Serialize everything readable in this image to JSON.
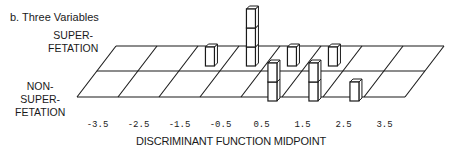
{
  "chart_data": {
    "type": "bar",
    "subtype": "3d-histogram",
    "title": "b. Three Variables",
    "xlabel": "DISCRIMINANT FUNCTION MIDPOINT",
    "ylabel": "",
    "categories": [
      "-3.5",
      "-2.5",
      "-1.5",
      "-0.5",
      "0.5",
      "1.5",
      "2.5",
      "3.5"
    ],
    "series": [
      {
        "name": "SUPER-\nFETATION",
        "label_lines": [
          "SUPER-",
          "FETATION"
        ],
        "values": [
          0,
          0,
          1,
          3,
          1,
          1,
          0,
          0
        ]
      },
      {
        "name": "NON-\nSUPER-\nFETATION",
        "label_lines": [
          "NON-",
          "SUPER-",
          "FETATION"
        ],
        "values": [
          0,
          0,
          0,
          0,
          2,
          2,
          1,
          0
        ]
      }
    ],
    "grid": true,
    "legend": "row labels on left"
  },
  "colors": {
    "line": "#1a1a1a",
    "box_fill": "#ffffff"
  }
}
